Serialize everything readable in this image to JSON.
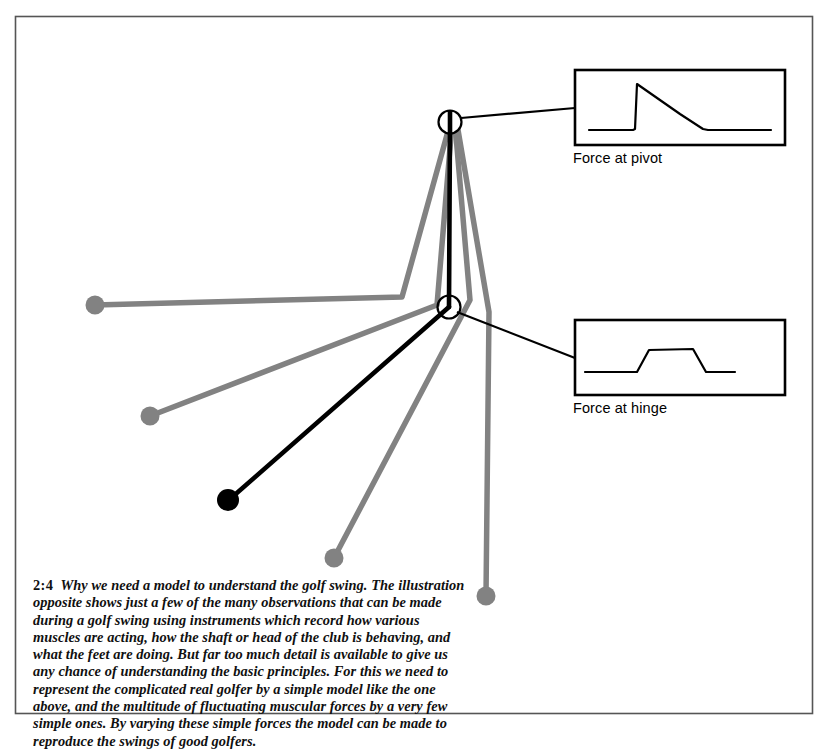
{
  "page": {
    "border": {
      "x": 15,
      "y": 16,
      "width": 798,
      "height": 698,
      "color": "#555555"
    },
    "background": "#ffffff"
  },
  "figure": {
    "name": "golf-swing-model-diagram",
    "colors": {
      "model_black": "#000000",
      "ghost_gray": "#828282",
      "box_stroke": "#000000"
    },
    "pivot_joint": {
      "cx": 450,
      "cy": 122,
      "r": 11
    },
    "hinge_joint": {
      "cx": 449,
      "cy": 307,
      "r": 11
    },
    "model_arm": {
      "from": [
        450,
        122
      ],
      "to": [
        449,
        307
      ]
    },
    "model_club": {
      "from": [
        449,
        307
      ],
      "to": [
        228,
        500
      ]
    },
    "model_club_head": {
      "cx": 228,
      "cy": 500,
      "r": 11
    },
    "ghost_swings": [
      {
        "name": "ghost-swing-1",
        "points": [
          [
            450,
            124
          ],
          [
            402,
            297
          ],
          [
            95,
            305
          ]
        ],
        "head": {
          "cx": 95,
          "cy": 305,
          "r": 9
        }
      },
      {
        "name": "ghost-swing-2",
        "points": [
          [
            452,
            124
          ],
          [
            437,
            305
          ],
          [
            150,
            416
          ]
        ],
        "head": {
          "cx": 150,
          "cy": 416,
          "r": 9
        }
      },
      {
        "name": "ghost-swing-3",
        "points": [
          [
            455,
            124
          ],
          [
            470,
            300
          ],
          [
            334,
            558
          ]
        ],
        "head": {
          "cx": 334,
          "cy": 558,
          "r": 9
        }
      },
      {
        "name": "ghost-swing-4",
        "points": [
          [
            457,
            124
          ],
          [
            489,
            312
          ],
          [
            486,
            596
          ]
        ],
        "head": {
          "cx": 486,
          "cy": 596,
          "r": 9
        }
      }
    ],
    "leader_lines": [
      {
        "name": "leader-to-pivot-plate",
        "from": [
          461,
          118
        ],
        "to": [
          575,
          108
        ]
      },
      {
        "name": "leader-to-hinge-plate",
        "from": [
          458,
          311
        ],
        "to": [
          575,
          358
        ]
      }
    ]
  },
  "plates": [
    {
      "id": "force-at-pivot",
      "label": "Force at pivot",
      "box": {
        "x": 575,
        "y": 70,
        "width": 210,
        "height": 75
      },
      "trace": {
        "type": "line",
        "description": "flat baseline, sharp vertical rise to peak, linear decay, flat baseline",
        "points": [
          [
            14,
            60
          ],
          [
            58,
            60
          ],
          [
            60,
            59
          ],
          [
            62,
            14
          ],
          [
            105,
            44
          ],
          [
            128,
            59
          ],
          [
            133,
            60
          ],
          [
            196,
            60
          ]
        ]
      }
    },
    {
      "id": "force-at-hinge",
      "label": "Force at hinge",
      "box": {
        "x": 575,
        "y": 320,
        "width": 210,
        "height": 75
      },
      "trace": {
        "type": "line",
        "description": "flat baseline, ramp up to plateau, plateau, ramp down to baseline",
        "points": [
          [
            10,
            52
          ],
          [
            62,
            52
          ],
          [
            74,
            30
          ],
          [
            118,
            29
          ],
          [
            131,
            52
          ],
          [
            160,
            52
          ]
        ]
      }
    }
  ],
  "caption": {
    "number": "2:4",
    "text": "Why we need a model to understand the golf swing. The illustration opposite shows just a few of the many observations that can be made during a golf swing using instruments which record how various muscles are acting, how the shaft or head of the club is behaving, and what the feet are doing. But far too much detail is available to give us any chance of understanding the basic principles. For this we need to represent the complicated real golfer by a simple model like the one above, and the multitude of fluctuating muscular forces by a very few simple ones. By varying these simple forces the model can be made to reproduce the swings of good golfers."
  }
}
